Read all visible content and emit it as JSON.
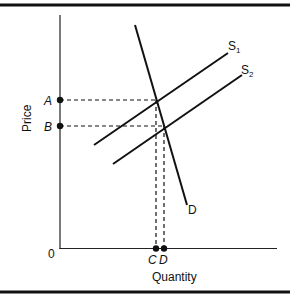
{
  "figure": {
    "type": "supply-demand-diagram",
    "axes": {
      "ylabel": "Price",
      "xlabel": "Quantity",
      "origin_label": "0"
    },
    "price_points": [
      {
        "label": "A",
        "description": "equilibrium price with S1"
      },
      {
        "label": "B",
        "description": "equilibrium price with S2"
      }
    ],
    "quantity_points": [
      {
        "label": "C",
        "description": "equilibrium quantity with S1"
      },
      {
        "label": "D",
        "description": "equilibrium quantity with S2"
      }
    ],
    "curves": {
      "demand": {
        "label": "D"
      },
      "supply1": {
        "label": "S",
        "subscript": "1"
      },
      "supply2": {
        "label": "S",
        "subscript": "2"
      }
    },
    "colors": {
      "line": "#111111",
      "background": "#ffffff"
    }
  }
}
